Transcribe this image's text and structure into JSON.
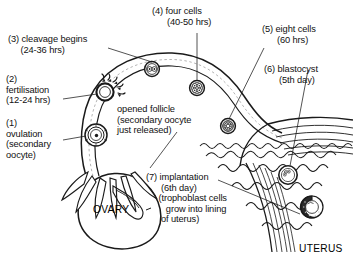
{
  "diagram": {
    "background_color": "#ffffff",
    "ink_color": "#1a1a1a"
  },
  "labels": {
    "step1": "(1)\novulation\n(secondary\noocyte)",
    "step2": "(2)\nfertilisation\n(12-24 hrs)",
    "step3": "(3) cleavage begins\n     (24-36 hrs)",
    "step4": "(4) four cells\n      (40-50 hrs)",
    "step5": "(5) eight cells\n      (60 hrs)",
    "step6": "(6) blastocyst\n      (5th day)",
    "step7": "(7) implantation\n      (6th day)\n     (trophoblast cells\n        grow into lining\n      of uterus)",
    "follicle_note": "opened follicle\n(secondary oocyte\njust released)"
  },
  "organs": {
    "ovary": "OVARY",
    "uterus": "UTERUS"
  },
  "structures": {
    "ovulation_oocyte": "released-secondary-oocyte",
    "fertilisation_site": "oocyte-with-sperm",
    "cleavage_embryo": "two-cell-embryo",
    "four_cell_embryo": "four-cell-embryo",
    "eight_cell_embryo": "eight-cell-embryo",
    "blastocyst": "free-blastocyst",
    "implanting_blastocyst": "implanting-blastocyst",
    "fimbriae": "fimbriae-fingers",
    "endometrium": "uterine-lining",
    "myometrium": "uterine-muscle-wall"
  }
}
